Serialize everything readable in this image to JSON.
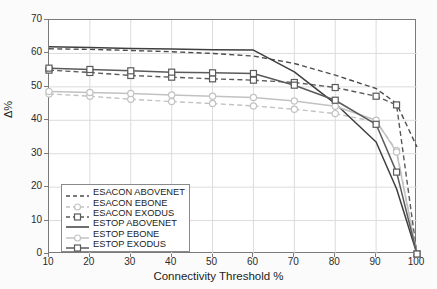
{
  "chart_data": {
    "type": "line",
    "title": "",
    "xlabel": "Connectivity Threshold %",
    "ylabel": "Δ%",
    "xlim": [
      10,
      100
    ],
    "ylim": [
      0,
      70
    ],
    "xticks": [
      10,
      20,
      30,
      40,
      50,
      60,
      70,
      80,
      90,
      100
    ],
    "yticks": [
      0,
      10,
      20,
      30,
      40,
      50,
      60,
      70
    ],
    "grid": true,
    "legend_position": "lower-left-inside",
    "x": [
      10,
      20,
      30,
      40,
      50,
      60,
      70,
      80,
      90,
      95,
      100
    ],
    "series": [
      {
        "name": "ESACON ABOVENET",
        "style": "dashed",
        "marker": "none",
        "color": "#4d4d4d",
        "values": [
          61.4,
          61.2,
          60.9,
          60.5,
          60.0,
          59.2,
          57.0,
          53.5,
          49.5,
          45.0,
          32.0
        ]
      },
      {
        "name": "ESACON EBONE",
        "style": "dashed",
        "marker": "circle",
        "color": "#c2c2c2",
        "values": [
          47.9,
          47.2,
          46.3,
          45.6,
          45.0,
          44.3,
          43.3,
          42.0,
          39.5,
          31.0,
          0.0
        ]
      },
      {
        "name": "ESACON EXODUS",
        "style": "dashed",
        "marker": "square",
        "color": "#5a5a5a",
        "values": [
          55.0,
          54.3,
          53.4,
          52.9,
          52.4,
          52.0,
          51.3,
          49.8,
          47.2,
          44.6,
          0.0
        ]
      },
      {
        "name": "ESTOP ABOVENET",
        "style": "solid",
        "marker": "none",
        "color": "#3f3f3f",
        "values": [
          62.0,
          61.8,
          61.5,
          61.3,
          61.1,
          61.0,
          54.5,
          45.0,
          33.5,
          19.5,
          0.0
        ]
      },
      {
        "name": "ESTOP EBONE",
        "style": "solid",
        "marker": "circle",
        "color": "#c2c2c2",
        "values": [
          48.6,
          48.3,
          48.0,
          47.6,
          47.2,
          46.8,
          45.8,
          44.2,
          40.0,
          30.5,
          0.0
        ]
      },
      {
        "name": "ESTOP EXODUS",
        "style": "solid",
        "marker": "square",
        "color": "#5a5a5a",
        "values": [
          55.6,
          55.2,
          54.8,
          54.4,
          54.2,
          54.0,
          50.5,
          46.0,
          38.8,
          24.5,
          0.0
        ]
      }
    ]
  },
  "axis": {
    "x_title": "Connectivity Threshold %",
    "y_title": "Δ%",
    "x_tick_labels": [
      "10",
      "20",
      "30",
      "40",
      "50",
      "60",
      "70",
      "80",
      "90",
      "100"
    ],
    "y_tick_labels": [
      "0",
      "10",
      "20",
      "30",
      "40",
      "50",
      "60",
      "70"
    ]
  },
  "legend": {
    "items": [
      {
        "label": "ESACON ABOVENET"
      },
      {
        "label": "ESACON EBONE"
      },
      {
        "label": "ESACON EXODUS"
      },
      {
        "label": "ESTOP ABOVENET"
      },
      {
        "label": "ESTOP EBONE"
      },
      {
        "label": "ESTOP EXODUS"
      }
    ]
  },
  "colors": {
    "dark": "#4d4d4d",
    "mid": "#5a5a5a",
    "light": "#c2c2c2",
    "grid": "#dcdcdc",
    "frame": "#7a7a7a",
    "background": "#fbfbfb",
    "plot_background": "#ffffff"
  }
}
